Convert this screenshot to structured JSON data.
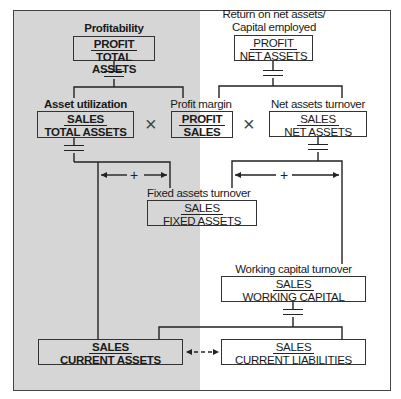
{
  "diagram": {
    "operators": {
      "multiply": "×",
      "plus": "+"
    },
    "nodes": {
      "profitability": {
        "label": "Profitability",
        "numerator": "PROFIT",
        "denominator": "TOTAL ASSETS"
      },
      "return_on_net_assets": {
        "label_line1": "Return on net assets/",
        "label_line2": "Capital employed",
        "numerator": "PROFIT",
        "denominator": "NET ASSETS"
      },
      "asset_utilization": {
        "label": "Asset utilization",
        "numerator": "SALES",
        "denominator": "TOTAL ASSETS"
      },
      "profit_margin": {
        "label": "Profit margin",
        "numerator": "PROFIT",
        "denominator": "SALES"
      },
      "net_assets_turnover": {
        "label": "Net assets turnover",
        "numerator": "SALES",
        "denominator": "NET ASSETS"
      },
      "fixed_assets_turnover": {
        "label": "Fixed assets turnover",
        "numerator": "SALES",
        "denominator": "FIXED ASSETS"
      },
      "working_capital_turnover": {
        "label": "Working capital turnover",
        "numerator": "SALES",
        "denominator": "WORKING CAPITAL"
      },
      "current_assets": {
        "numerator": "SALES",
        "denominator": "CURRENT ASSETS"
      },
      "current_liabilities": {
        "numerator": "SALES",
        "denominator": "CURRENT LIABILITIES"
      }
    },
    "colors": {
      "shaded_panel": "#d6d6d6",
      "line": "#222222"
    }
  }
}
